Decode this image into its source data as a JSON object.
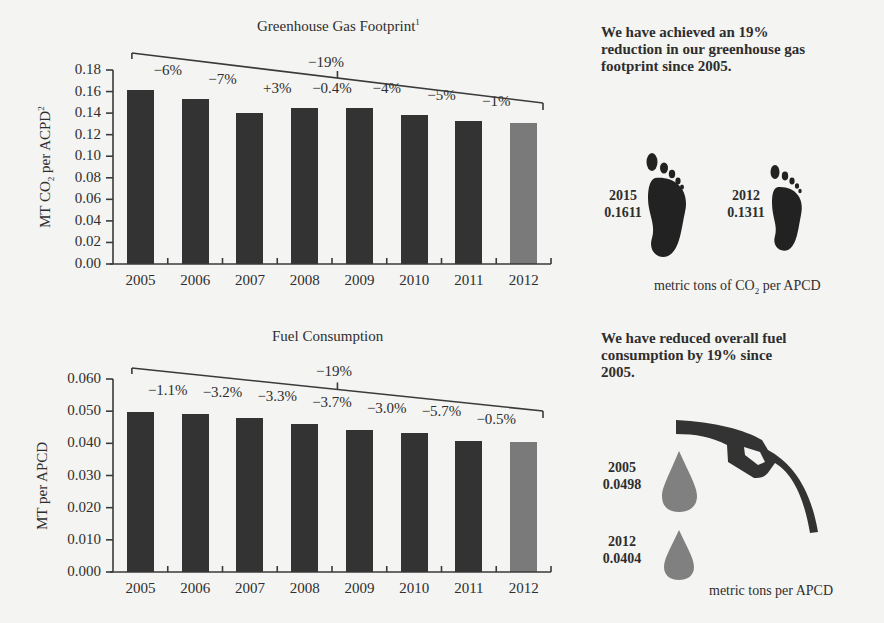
{
  "chart_data": [
    {
      "type": "bar",
      "title": "Greenhouse Gas Footprint",
      "title_sup": "1",
      "xlabel": "",
      "ylabel": "MT CO2 per ACPD2",
      "categories": [
        "2005",
        "2006",
        "2007",
        "2008",
        "2009",
        "2010",
        "2011",
        "2012"
      ],
      "values": [
        0.161,
        0.153,
        0.14,
        0.145,
        0.145,
        0.138,
        0.133,
        0.131
      ],
      "annotations": [
        "-6%",
        "-7%",
        "+3%",
        "-0.4%",
        "-4%",
        "-5%",
        "-1%"
      ],
      "overall_change": "-19%",
      "yticks": [
        "0.18",
        "0.16",
        "0.14",
        "0.12",
        "0.10",
        "0.08",
        "0.06",
        "0.04",
        "0.02",
        "0.00"
      ],
      "ylim": [
        0,
        0.18
      ],
      "highlight_last": true
    },
    {
      "type": "bar",
      "title": "Fuel Consumption",
      "xlabel": "",
      "ylabel": "MT per APCD",
      "categories": [
        "2005",
        "2006",
        "2007",
        "2008",
        "2009",
        "2010",
        "2011",
        "2012"
      ],
      "values": [
        0.0498,
        0.0492,
        0.0478,
        0.046,
        0.0443,
        0.0432,
        0.0406,
        0.0404
      ],
      "annotations": [
        "-1.1%",
        "-3.2%",
        "-3.3%",
        "-3.7%",
        "-3.0%",
        "-5.7%",
        "-0.5%"
      ],
      "overall_change": "-19%",
      "yticks": [
        "0.060",
        "0.050",
        "0.040",
        "0.030",
        "0.020",
        "0.010",
        "0.000"
      ],
      "ylim": [
        0,
        0.06
      ],
      "highlight_last": true
    }
  ],
  "ghg": {
    "title": "Greenhouse Gas Footprint",
    "title_sup": "1",
    "ylabel_a": "MT CO",
    "ylabel_sub": "2",
    "ylabel_b": " per ACPD",
    "ylabel_sup": "2",
    "overall": "−19%",
    "callout": "We have achieved an 19% reduction in our greenhouse gas footprint since 2005.",
    "stat1_year": "2015",
    "stat1_value": "0.1611",
    "stat2_year": "2012",
    "stat2_value": "0.1311",
    "unit_a": "metric tons of CO",
    "unit_sub": "2",
    "unit_b": " per APCD",
    "icon": "footprint-icon"
  },
  "fuel": {
    "title": "Fuel Consumption",
    "ylabel": "MT per APCD",
    "overall": "−19%",
    "callout": "We have reduced overall fuel consumption by 19% since 2005.",
    "stat1_year": "2005",
    "stat1_value": "0.0498",
    "stat2_year": "2012",
    "stat2_value": "0.0404",
    "unit": "metric tons per APCD",
    "icon": "fuel-nozzle-icon"
  },
  "colors": {
    "bar": "#333333",
    "bar_highlight": "#7a7a7a",
    "drop": "#808080",
    "background": "#f4f4f2"
  }
}
